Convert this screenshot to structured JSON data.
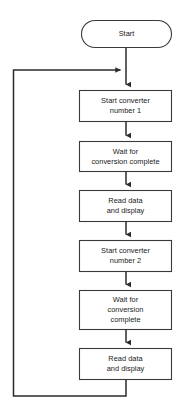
{
  "diagram": {
    "type": "flowchart",
    "orientation": "vertical",
    "background_color": "#ffffff",
    "stroke_color": "#2b2b2b",
    "text_color": "#1a1a1a",
    "fill_color": "#ffffff"
  },
  "nodes": [
    {
      "id": "start",
      "shape": "stadium",
      "label": "Start",
      "lines": [
        "Start"
      ],
      "x": 81,
      "y": 20,
      "w": 91,
      "h": 28
    },
    {
      "id": "start-converter-1",
      "shape": "process",
      "label": "Start converter number 1",
      "lines": [
        "Start converter",
        "number 1"
      ],
      "x": 79,
      "y": 90,
      "w": 93,
      "h": 32
    },
    {
      "id": "wait-conversion-1",
      "shape": "process",
      "label": "Wait for conversion complete",
      "lines": [
        "Wait for",
        "conversion complete"
      ],
      "x": 79,
      "y": 141,
      "w": 93,
      "h": 31
    },
    {
      "id": "read-display-1",
      "shape": "process",
      "label": "Read data and display",
      "lines": [
        "Read data",
        "and display"
      ],
      "x": 79,
      "y": 190,
      "w": 93,
      "h": 32
    },
    {
      "id": "start-converter-2",
      "shape": "process",
      "label": "Start converter number 2",
      "lines": [
        "Start converter",
        "number 2"
      ],
      "x": 79,
      "y": 240,
      "w": 93,
      "h": 32
    },
    {
      "id": "wait-conversion-2",
      "shape": "process",
      "label": "Wait for conversion complete",
      "lines": [
        "Wait for",
        "conversion",
        "complete"
      ],
      "x": 79,
      "y": 290,
      "w": 93,
      "h": 40
    },
    {
      "id": "read-display-2",
      "shape": "process",
      "label": "Read data and display",
      "lines": [
        "Read data",
        "and display"
      ],
      "x": 79,
      "y": 348,
      "w": 93,
      "h": 32
    }
  ],
  "edges": [
    {
      "id": "e-start-to-box1",
      "from": "start",
      "to": "start-converter-1",
      "arrow": "down"
    },
    {
      "id": "e-box1-to-box2",
      "from": "start-converter-1",
      "to": "wait-conversion-1",
      "arrow": "down"
    },
    {
      "id": "e-box2-to-box3",
      "from": "wait-conversion-1",
      "to": "read-display-1",
      "arrow": "down"
    },
    {
      "id": "e-box3-to-box4",
      "from": "read-display-1",
      "to": "start-converter-2",
      "arrow": "down"
    },
    {
      "id": "e-box4-to-box5",
      "from": "start-converter-2",
      "to": "wait-conversion-2",
      "arrow": "down"
    },
    {
      "id": "e-box5-to-box6",
      "from": "wait-conversion-2",
      "to": "read-display-2",
      "arrow": "down"
    },
    {
      "id": "e-loop-back",
      "from": "read-display-2",
      "to": "start-converter-1",
      "arrow": "right",
      "type": "feedback-loop"
    }
  ],
  "text_labels": {
    "start": "Start",
    "start_converter_1_line1": "Start converter",
    "start_converter_1_line2": "number 1",
    "wait_1_line1": "Wait for",
    "wait_1_line2": "conversion complete",
    "read_1_line1": "Read data",
    "read_1_line2": "and display",
    "start_converter_2_line1": "Start converter",
    "start_converter_2_line2": "number 2",
    "wait_2_line1": "Wait for",
    "wait_2_line2": "conversion",
    "wait_2_line3": "complete",
    "read_2_line1": "Read data",
    "read_2_line2": "and display"
  }
}
